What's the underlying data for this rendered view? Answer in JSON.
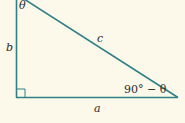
{
  "diagram": {
    "type": "right-triangle",
    "colors": {
      "background": "#fdf9ea",
      "stroke": "#2f8087",
      "text": "#2b2b2b"
    },
    "labels": {
      "top_angle": "θ",
      "vertical_side": "b",
      "hypotenuse": "c",
      "bottom_right_angle": "90° − θ",
      "horizontal_side": "a"
    }
  }
}
